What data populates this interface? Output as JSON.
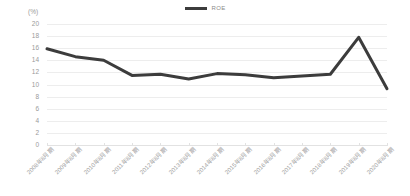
{
  "legend": {
    "entries": [
      {
        "label": "ROE",
        "color": "#3c3c3c"
      }
    ]
  },
  "axis": {
    "unit_label": "(%)",
    "y_ticks": [
      "20",
      "18",
      "16",
      "14",
      "12",
      "10",
      "8",
      "6",
      "4",
      "2",
      "0"
    ]
  },
  "chart_data": {
    "type": "line",
    "title": "",
    "subtitle": "",
    "xlabel": "",
    "ylabel": "(%)",
    "ylim": [
      0,
      20
    ],
    "ytick_step": 2,
    "grid": true,
    "legend_position": "top-center",
    "line_color": "#3c3c3c",
    "line_width": 3,
    "markers": false,
    "categories": [
      "2008年8月期",
      "2009年8月期",
      "2010年8月期",
      "2011年8月期",
      "2012年8月期",
      "2013年8月期",
      "2014年8月期",
      "2015年8月期",
      "2016年8月期",
      "2017年8月期",
      "2018年8月期",
      "2019年8月期",
      "2020年8月期"
    ],
    "series": [
      {
        "name": "ROE",
        "color": "#3c3c3c",
        "values": [
          15.9,
          14.6,
          14.0,
          11.5,
          11.7,
          10.9,
          11.8,
          11.6,
          11.1,
          11.4,
          11.7,
          17.8,
          9.3
        ]
      }
    ]
  }
}
